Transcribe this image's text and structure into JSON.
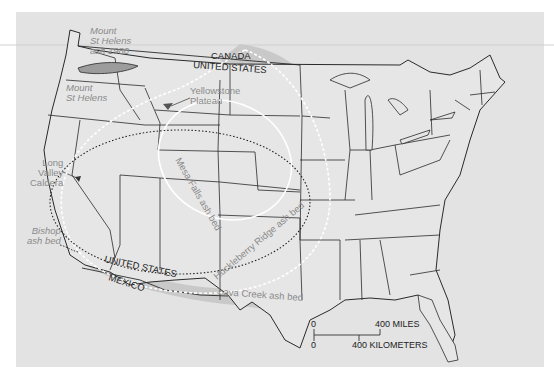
{
  "map": {
    "title_labels": {
      "canada": "CANADA",
      "us_north": "UNITED STATES",
      "us_south": "UNITED STATES",
      "mexico": "MEXICO"
    },
    "sources": [
      {
        "id": "mount-st-helens",
        "lines": [
          "Mount",
          "St Helens"
        ]
      },
      {
        "id": "yellowstone-plateau",
        "lines": [
          "Yellowstone",
          "Plateau"
        ]
      },
      {
        "id": "long-valley-caldera",
        "lines": [
          "Long",
          "Valley",
          "Caldera"
        ]
      }
    ],
    "ash_beds": [
      {
        "id": "mount-st-helens-1980",
        "lines": [
          "Mount",
          "St Helens",
          "ash 1980"
        ],
        "style": "dark gray filled lens"
      },
      {
        "id": "bishop",
        "lines": [
          "Bishop",
          "ash bed"
        ],
        "style": "black dotted outline"
      },
      {
        "id": "mesa-falls",
        "label": "Mesa Falls ash bed",
        "style": "solid white outline"
      },
      {
        "id": "huckleberry-ridge",
        "label": "Huckleberry Ridge ash bed",
        "style": "white dashed outline"
      },
      {
        "id": "lava-creek",
        "label": "Lava Creek ash bed",
        "style": "gray filled region"
      }
    ],
    "scale_bar": {
      "miles_zero": "0",
      "miles_label": "400 MILES",
      "km_zero": "0",
      "km_label": "400 KILOMETERS"
    },
    "colors": {
      "background": "#e3e3e3",
      "land": "#e6e6e6",
      "lava_creek_fill": "#c9c9c9",
      "lava_creek_core": "#b8b8b8",
      "st_helens_fill": "#9c9c9c",
      "borders": "#2a2a2a",
      "label_gray": "#8a8a8a"
    }
  }
}
